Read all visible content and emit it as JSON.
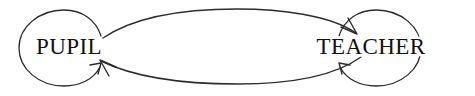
{
  "diagram": {
    "background_color": "#ffffff",
    "stroke_color": "#2b2b2b",
    "text_color": "#111111",
    "nodes": [
      {
        "id": "pupil",
        "label": "PUPIL",
        "center_x": 69,
        "center_y": 48,
        "self_loop": true,
        "self_loop_name": "pupil-self-loop"
      },
      {
        "id": "teacher",
        "label": "TEACHER",
        "center_x": 371,
        "center_y": 48,
        "self_loop": true,
        "self_loop_name": "teacher-self-loop"
      }
    ],
    "edges": [
      {
        "id": "pupil-to-teacher",
        "from": "pupil",
        "to": "teacher",
        "label": "",
        "direction": "left-to-right",
        "position": "top-arc"
      },
      {
        "id": "teacher-to-pupil",
        "from": "teacher",
        "to": "pupil",
        "label": "",
        "direction": "right-to-left",
        "position": "bottom-arc"
      }
    ]
  }
}
